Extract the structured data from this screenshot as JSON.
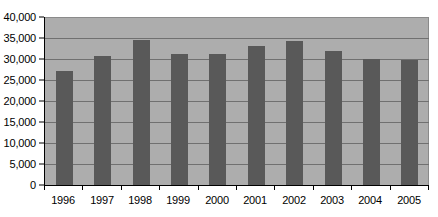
{
  "chart_data": {
    "type": "bar",
    "title": "",
    "subtitle": "",
    "xlabel": "",
    "ylabel": "",
    "categories": [
      "1996",
      "1997",
      "1998",
      "1999",
      "2000",
      "2001",
      "2002",
      "2003",
      "2004",
      "2005"
    ],
    "values": [
      27200,
      30700,
      34600,
      31100,
      31300,
      33100,
      34400,
      32000,
      30100,
      29800
    ],
    "series": [
      {
        "name": "",
        "values": [
          27200,
          30700,
          34600,
          31100,
          31300,
          33100,
          34400,
          32000,
          30100,
          29800
        ]
      }
    ],
    "ylim": [
      0,
      40000
    ],
    "ytick_values": [
      0,
      5000,
      10000,
      15000,
      20000,
      25000,
      30000,
      35000,
      40000
    ],
    "ytick_labels": [
      "0",
      "5,000",
      "10,000",
      "15,000",
      "20,000",
      "25,000",
      "30,000",
      "35,000",
      "40,000"
    ],
    "grid": true,
    "grid_axis": "y",
    "legend": false,
    "legend_position": "none",
    "annotations": []
  },
  "style": {
    "plot_background": "#adadad",
    "bar_color": "#595959",
    "gridline_color": "#707070",
    "axis_color": "#000000",
    "page_background": "#ffffff",
    "text_color": "#000000"
  }
}
